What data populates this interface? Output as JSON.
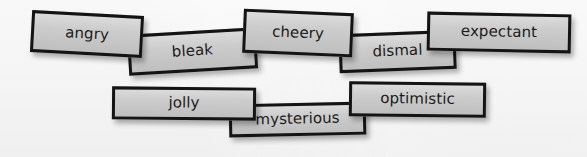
{
  "scene": {
    "title": "Word cards",
    "background_color": "#fdfdfd",
    "card_fill_color": "#c9c9c9",
    "card_border_color": "#141414",
    "text_color": "#1b1b1b"
  },
  "rows": [
    {
      "name": "row-1",
      "cards": [
        {
          "label": "angry",
          "rotation_deg": 3.1
        },
        {
          "label": "bleak",
          "rotation_deg": -3.4
        },
        {
          "label": "cheery",
          "rotation_deg": 2.4
        },
        {
          "label": "dismal",
          "rotation_deg": -2.2
        },
        {
          "label": "expectant",
          "rotation_deg": 1.1
        }
      ]
    },
    {
      "name": "row-2",
      "cards": [
        {
          "label": "jolly",
          "rotation_deg": 0.5
        },
        {
          "label": "mysterious",
          "rotation_deg": -1.2
        },
        {
          "label": "optimistic",
          "rotation_deg": 0.7
        }
      ]
    }
  ]
}
